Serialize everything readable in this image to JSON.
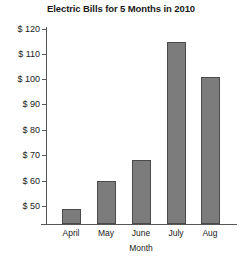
{
  "chart_data": {
    "type": "bar",
    "title": "Electric Bills for 5 Months in 2010",
    "xlabel": "Month",
    "ylabel": "",
    "categories": [
      "April",
      "May",
      "June",
      "July",
      "Aug"
    ],
    "values": [
      49,
      60,
      68,
      115,
      101
    ],
    "ytick_labels": [
      "$ 120",
      "$ 110",
      "$ 100",
      "$ 90",
      "$ 80",
      "$ 70",
      "$ 60",
      "$ 50"
    ],
    "ytick_values": [
      120,
      110,
      100,
      90,
      80,
      70,
      60,
      50
    ],
    "ylim": [
      42,
      120
    ],
    "grid": false,
    "legend": null,
    "bar_color": "#7c7c7c",
    "bar_edge_color": "#4a4a4a",
    "axis_color": "#565656"
  }
}
